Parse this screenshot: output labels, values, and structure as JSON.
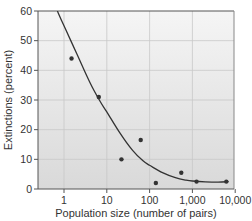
{
  "chart_data": {
    "type": "scatter",
    "title": "",
    "xlabel": "Population size (number of pairs)",
    "ylabel": "Extinctions (percent)",
    "xscale": "log",
    "xlim": [
      0.25,
      10000
    ],
    "ylim": [
      0,
      60
    ],
    "x_ticks": [
      1,
      10,
      100,
      1000,
      10000
    ],
    "x_tick_labels": [
      "1",
      "10",
      "100",
      "1,000",
      "10,000"
    ],
    "y_ticks": [
      0,
      10,
      20,
      30,
      40,
      50,
      60
    ],
    "y_tick_labels": [
      "0",
      "10",
      "20",
      "30",
      "40",
      "50",
      "60"
    ],
    "grid": true,
    "legend": null,
    "series": [
      {
        "name": "Observed extinctions",
        "type": "scatter",
        "x": [
          1.5,
          6.5,
          22,
          62,
          140,
          550,
          1250,
          6200
        ],
        "y": [
          44,
          31,
          10,
          16.5,
          2,
          5.5,
          2.5,
          2.5
        ]
      },
      {
        "name": "Fitted curve",
        "type": "line",
        "x": [
          0.7,
          1,
          2,
          4,
          7,
          10,
          20,
          40,
          70,
          100,
          200,
          400,
          700,
          1000,
          2000,
          4000,
          7000
        ],
        "y": [
          60,
          55,
          45.5,
          36,
          29.5,
          26,
          19,
          13,
          9.5,
          8,
          5.5,
          3.8,
          3,
          2.7,
          2.4,
          2.3,
          2.5
        ]
      }
    ]
  },
  "colors": {
    "plot_bg_top": "#f5f5f5",
    "plot_bg_bottom": "#d9d9d9",
    "grid": "#c8c8c8",
    "axis": "#555555",
    "curve": "#333333",
    "points": "#333333"
  }
}
